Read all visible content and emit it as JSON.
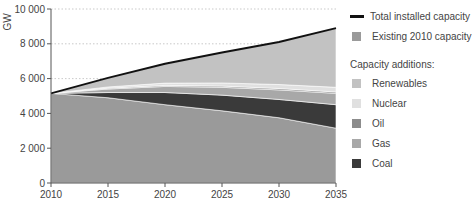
{
  "chart_data": {
    "type": "area",
    "title": "",
    "xlabel": "",
    "ylabel": "GW",
    "x": [
      2010,
      2015,
      2020,
      2025,
      2030,
      2035
    ],
    "xlim": [
      2010,
      2035
    ],
    "ylim": [
      0,
      10000
    ],
    "x_ticks": [
      "2010",
      "2015",
      "2020",
      "2025",
      "2030",
      "2035"
    ],
    "y_ticks": [
      "0",
      "2 000",
      "4 000",
      "6 000",
      "8 000",
      "10 000"
    ],
    "y_tick_values": [
      0,
      2000,
      4000,
      6000,
      8000,
      10000
    ],
    "grid": "horizontal dotted",
    "legend_position": "right",
    "stack_order": [
      "Existing 2010 capacity",
      "Coal",
      "Gas",
      "Oil",
      "Nuclear",
      "Renewables"
    ],
    "series": [
      {
        "name": "Existing 2010 capacity",
        "color": "#9a9a9a",
        "values": [
          5150,
          4900,
          4500,
          4150,
          3750,
          3150
        ]
      },
      {
        "name": "Coal",
        "color": "#3a3a3a",
        "values": [
          0,
          300,
          700,
          900,
          1050,
          1350
        ]
      },
      {
        "name": "Gas",
        "color": "#a8a8a8",
        "values": [
          0,
          200,
          350,
          450,
          550,
          650
        ]
      },
      {
        "name": "Oil",
        "color": "#8c8c8c",
        "values": [
          0,
          50,
          60,
          70,
          80,
          80
        ]
      },
      {
        "name": "Nuclear",
        "color": "#e0e0e0",
        "values": [
          0,
          70,
          130,
          180,
          230,
          270
        ]
      },
      {
        "name": "Renewables",
        "color": "#c2c2c2",
        "values": [
          0,
          520,
          1110,
          1750,
          2440,
          3400
        ]
      }
    ],
    "line_series": {
      "name": "Total installed capacity",
      "color": "#111111",
      "values": [
        5150,
        6040,
        6850,
        7500,
        8100,
        8900
      ]
    }
  },
  "legend": {
    "total_label": "Total installed capacity",
    "existing_label": "Existing 2010 capacity",
    "additions_heading": "Capacity additions:",
    "items": [
      {
        "label": "Renewables",
        "color": "#c2c2c2"
      },
      {
        "label": "Nuclear",
        "color": "#e0e0e0"
      },
      {
        "label": "Oil",
        "color": "#8c8c8c"
      },
      {
        "label": "Gas",
        "color": "#a8a8a8"
      },
      {
        "label": "Coal",
        "color": "#3a3a3a"
      }
    ]
  }
}
